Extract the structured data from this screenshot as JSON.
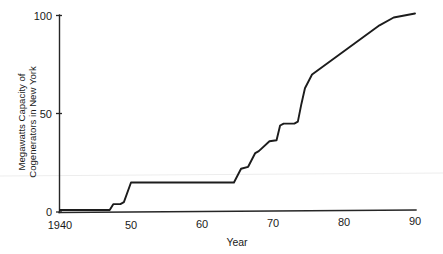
{
  "chart_data": {
    "type": "line",
    "title": "",
    "xlabel": "Year",
    "ylabel": "Megawatts Capacity of Cogenerators in New York",
    "ylabel_line1": "Megawatts Capacity of",
    "ylabel_line2": "Cogenerators in New York",
    "xlim": [
      1940,
      1990
    ],
    "ylim": [
      0,
      105
    ],
    "xticks": [
      1940,
      1950,
      1960,
      1970,
      1980,
      1990
    ],
    "xtick_labels": [
      "1940",
      "50",
      "60",
      "70",
      "80",
      "90"
    ],
    "yticks": [
      0,
      50,
      100
    ],
    "ytick_labels": [
      "0",
      "50",
      "100"
    ],
    "grid": false,
    "legend": false,
    "series": [
      {
        "name": "Megawatts Capacity of Cogenerators in New York",
        "color": "#1c1c1c",
        "x": [
          1940,
          1946,
          1947,
          1947.5,
          1948.5,
          1949,
          1950,
          1964,
          1964.5,
          1965.5,
          1966.5,
          1967.5,
          1968,
          1969.5,
          1970.5,
          1971,
          1971.5,
          1973,
          1973.5,
          1974,
          1974.5,
          1975.5,
          1985,
          1987,
          1990
        ],
        "y": [
          1,
          1,
          1,
          4,
          4,
          5,
          15,
          15,
          15,
          22,
          23,
          30,
          31,
          36,
          36.5,
          44,
          45,
          45,
          46,
          55,
          63,
          70,
          95,
          99,
          101
        ]
      }
    ]
  },
  "axes": {
    "x_axis_name": "year-axis",
    "y_axis_name": "megawatts-axis"
  }
}
